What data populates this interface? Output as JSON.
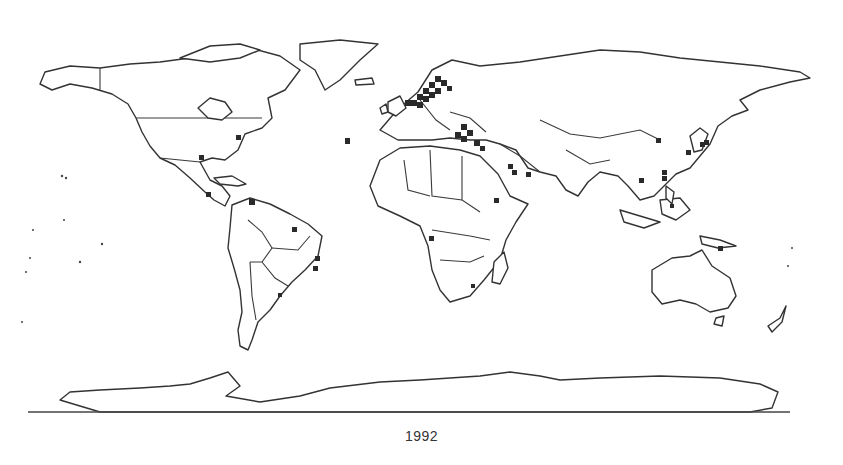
{
  "figure": {
    "title_fragment": "",
    "caption": "1992",
    "colors": {
      "background": "#ffffff",
      "outline": "#333333",
      "marker": "#2a2a2a",
      "caption": "#333333"
    }
  },
  "map": {
    "projection": "world (equirectangular-like)",
    "style": "black-and-white country outlines",
    "marker_shape": "filled-square",
    "marker_regions": [
      "Scandinavia / Northern Europe",
      "United Kingdom / Low Countries",
      "Balkans / Eastern Mediterranean",
      "Turkey / Middle East",
      "Persian Gulf",
      "Horn of Africa",
      "Central Africa (west coast)",
      "Southern Africa (Mozambique)",
      "East Asia (Korea / Japan)",
      "South China coast",
      "Philippines",
      "Papua New Guinea",
      "US East Coast",
      "Gulf of Mexico",
      "Central America",
      "Venezuela / Caribbean",
      "Brazil (northeast coast)",
      "Brazil (southeast coast)",
      "Uruguay / Rio de la Plata",
      "Azores / Atlantic island"
    ]
  }
}
